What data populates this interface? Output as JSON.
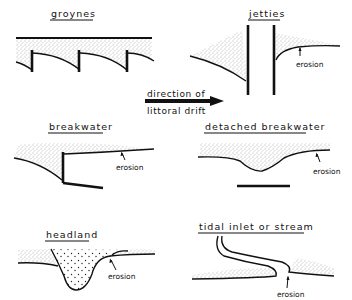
{
  "figure": {
    "panels": [
      {
        "id": "groynes",
        "title": "groynes"
      },
      {
        "id": "jetties",
        "title": "jetties",
        "annotation": "erosion"
      },
      {
        "id": "breakwater",
        "title": "breakwater",
        "annotation": "erosion"
      },
      {
        "id": "detached-breakwater",
        "title": "detached breakwater",
        "annotation": "erosion"
      },
      {
        "id": "headland",
        "title": "headland",
        "annotation": "erosion"
      },
      {
        "id": "tidal-inlet",
        "title": "tidal inlet or stream",
        "annotation": "erosion"
      }
    ],
    "arrow": {
      "line1": "direction of",
      "line2": "littoral drift",
      "direction": "right"
    },
    "colors": {
      "ink": "#111111",
      "background": "#ffffff",
      "stipple": "#555555"
    }
  }
}
